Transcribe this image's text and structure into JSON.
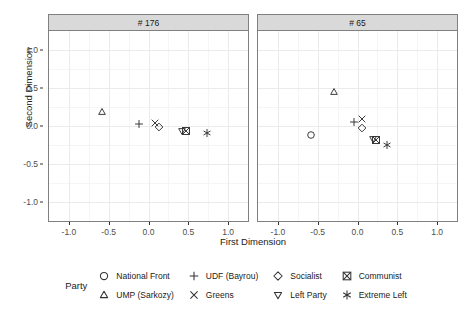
{
  "chart_data": {
    "type": "scatter",
    "title": "",
    "xlabel": "First Dimension",
    "ylabel": "Second Dimension",
    "xlim": [
      -1.25,
      1.25
    ],
    "ylim": [
      -1.25,
      1.25
    ],
    "xticks": [
      "-1.0",
      "-0.5",
      "0.0",
      "0.5",
      "1.0"
    ],
    "xtick_values": [
      -1.0,
      -0.5,
      0.0,
      0.5,
      1.0
    ],
    "yticks": [
      "1.0",
      "0.5",
      "0.0",
      "-0.5",
      "-1.0"
    ],
    "ytick_values": [
      1.0,
      0.5,
      0.0,
      -0.5,
      -1.0
    ],
    "grid": true,
    "legend_position": "bottom",
    "legend_title": "Party",
    "facets": [
      {
        "label": "# 176",
        "points": [
          {
            "party": "UMP (Sarkozy)",
            "marker": "triangle",
            "x": -0.58,
            "y": 0.18
          },
          {
            "party": "UDF (Bayrou)",
            "marker": "plus",
            "x": -0.12,
            "y": 0.02
          },
          {
            "party": "Greens",
            "marker": "cross",
            "x": 0.08,
            "y": 0.04
          },
          {
            "party": "Socialist",
            "marker": "diamond",
            "x": 0.13,
            "y": -0.01
          },
          {
            "party": "Left Party",
            "marker": "triangle-down",
            "x": 0.42,
            "y": -0.07
          },
          {
            "party": "Communist",
            "marker": "boxed-cross",
            "x": 0.47,
            "y": -0.07
          },
          {
            "party": "Extreme Left",
            "marker": "asterisk",
            "x": 0.73,
            "y": -0.09
          }
        ]
      },
      {
        "label": "# 65",
        "points": [
          {
            "party": "UMP (Sarkozy)",
            "marker": "triangle",
            "x": -0.3,
            "y": 0.45
          },
          {
            "party": "National Front",
            "marker": "circle",
            "x": -0.59,
            "y": -0.12
          },
          {
            "party": "Greens",
            "marker": "cross",
            "x": 0.06,
            "y": 0.09
          },
          {
            "party": "UDF (Bayrou)",
            "marker": "plus",
            "x": -0.05,
            "y": 0.05
          },
          {
            "party": "Socialist",
            "marker": "diamond",
            "x": 0.06,
            "y": -0.02
          },
          {
            "party": "Left Party",
            "marker": "triangle-down",
            "x": 0.2,
            "y": -0.17
          },
          {
            "party": "Communist",
            "marker": "boxed-cross",
            "x": 0.23,
            "y": -0.18
          },
          {
            "party": "Extreme Left",
            "marker": "asterisk",
            "x": 0.37,
            "y": -0.25
          }
        ]
      }
    ],
    "legend_entries": [
      {
        "label": "National Front",
        "marker": "circle"
      },
      {
        "label": "UDF (Bayrou)",
        "marker": "plus"
      },
      {
        "label": "Socialist",
        "marker": "diamond"
      },
      {
        "label": "Communist",
        "marker": "boxed-cross"
      },
      {
        "label": "UMP (Sarkozy)",
        "marker": "triangle"
      },
      {
        "label": "Greens",
        "marker": "cross"
      },
      {
        "label": "Left Party",
        "marker": "triangle-down"
      },
      {
        "label": "Extreme Left",
        "marker": "asterisk"
      }
    ]
  },
  "colors": {
    "marker": "#333333",
    "panel_border": "#808080",
    "strip_bg": "#d9d9d9",
    "grid_major": "#ebebeb",
    "grid_minor": "#f5f5f5",
    "text": "#1a1a1a",
    "tick_text": "#4d4d4d"
  }
}
